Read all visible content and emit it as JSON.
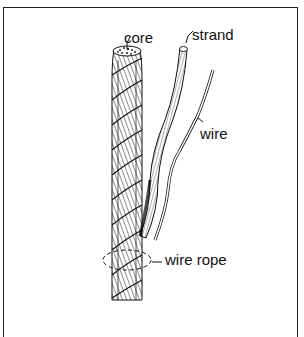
{
  "figure": {
    "labels": {
      "core": "core",
      "strand": "strand",
      "wire": "wire",
      "wire_rope": "wire rope"
    },
    "colors": {
      "ink": "#111111",
      "frame": "#222222",
      "background": "#ffffff"
    }
  }
}
